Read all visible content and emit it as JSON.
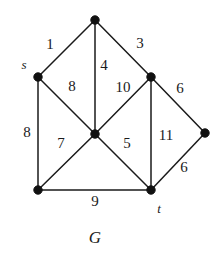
{
  "figure": {
    "caption": "G",
    "caption_x": 95,
    "caption_y": 237,
    "width": 212,
    "height": 259,
    "background": "#ffffff",
    "ink_color": "#1a1a1a"
  },
  "graph": {
    "type": "undirected-weighted-graph",
    "node_radius": 4.2,
    "nodes": [
      {
        "id": "top",
        "x": 95,
        "y": 20,
        "label": "",
        "label_x": 0,
        "label_y": 0
      },
      {
        "id": "s",
        "x": 38,
        "y": 77,
        "label": "s",
        "label_x": 24,
        "label_y": 64
      },
      {
        "id": "upper_right",
        "x": 151,
        "y": 77,
        "label": "",
        "label_x": 0,
        "label_y": 0
      },
      {
        "id": "center",
        "x": 95,
        "y": 134,
        "label": "",
        "label_x": 0,
        "label_y": 0
      },
      {
        "id": "far_right",
        "x": 205,
        "y": 133,
        "label": "",
        "label_x": 0,
        "label_y": 0
      },
      {
        "id": "bottom_left",
        "x": 38,
        "y": 190,
        "label": "",
        "label_x": 0,
        "label_y": 0
      },
      {
        "id": "t",
        "x": 151,
        "y": 190,
        "label": "t",
        "label_x": 159,
        "label_y": 208
      }
    ],
    "edges": [
      {
        "from": "s",
        "to": "top",
        "weight": "1",
        "label_x": 50,
        "label_y": 44
      },
      {
        "from": "top",
        "to": "upper_right",
        "weight": "3",
        "label_x": 140,
        "label_y": 43
      },
      {
        "from": "top",
        "to": "center",
        "weight": "4",
        "label_x": 104,
        "label_y": 65
      },
      {
        "from": "s",
        "to": "center",
        "weight": "8",
        "label_x": 72,
        "label_y": 86
      },
      {
        "from": "upper_right",
        "to": "center",
        "weight": "10",
        "label_x": 123,
        "label_y": 87
      },
      {
        "from": "upper_right",
        "to": "far_right",
        "weight": "6",
        "label_x": 180,
        "label_y": 88
      },
      {
        "from": "s",
        "to": "bottom_left",
        "weight": "8",
        "label_x": 27,
        "label_y": 132
      },
      {
        "from": "center",
        "to": "bottom_left",
        "weight": "7",
        "label_x": 61,
        "label_y": 143
      },
      {
        "from": "center",
        "to": "t",
        "weight": "5",
        "label_x": 127,
        "label_y": 143
      },
      {
        "from": "upper_right",
        "to": "t",
        "weight": "11",
        "label_x": 166,
        "label_y": 135
      },
      {
        "from": "far_right",
        "to": "t",
        "weight": "6",
        "label_x": 184,
        "label_y": 167
      },
      {
        "from": "bottom_left",
        "to": "t",
        "weight": "9",
        "label_x": 95,
        "label_y": 201
      }
    ]
  }
}
